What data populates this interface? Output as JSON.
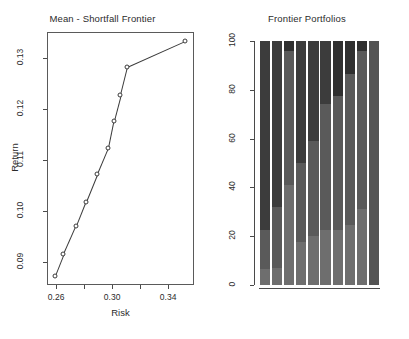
{
  "figure": {
    "panels": 2,
    "background": "#ffffff"
  },
  "left_panel": {
    "title": "Mean - Shortfall Frontier",
    "xlabel": "Risk",
    "ylabel": "Return"
  },
  "right_panel": {
    "title": "Frontier Portfolios"
  },
  "chart_data": [
    {
      "type": "line",
      "title": "Mean - Shortfall Frontier",
      "xlabel": "Risk",
      "ylabel": "Return",
      "xlim": [
        0.2535,
        0.3585
      ],
      "ylim": [
        0.0855,
        0.1352
      ],
      "xticks": [
        0.26,
        0.28,
        0.3,
        0.32,
        0.34
      ],
      "xticklabels": [
        "0.26",
        "",
        "0.30",
        "",
        "0.34"
      ],
      "yticks": [
        0.09,
        0.1,
        0.11,
        0.12,
        0.13
      ],
      "yticklabels": [
        "0.09",
        "0.10",
        "0.11",
        "0.12",
        "0.13"
      ],
      "grid": false,
      "legend": null,
      "marker": "open-circle",
      "series": [
        {
          "name": "Efficient frontier",
          "x": [
            0.259,
            0.2652,
            0.2742,
            0.281,
            0.2893,
            0.297,
            0.301,
            0.3058,
            0.3108,
            0.3523
          ],
          "y": [
            0.0872,
            0.0915,
            0.0971,
            0.1018,
            0.1074,
            0.1124,
            0.1178,
            0.1228,
            0.1283,
            0.1334
          ]
        }
      ]
    },
    {
      "type": "bar",
      "subtype": "stacked-percent",
      "title": "Frontier Portfolios",
      "xlabel": "",
      "ylabel": "",
      "ylim": [
        0,
        100
      ],
      "yticks": [
        0,
        20,
        40,
        60,
        80,
        100
      ],
      "yticklabels": [
        "0",
        "20",
        "40",
        "60",
        "80",
        "100"
      ],
      "xticklabels": [
        "",
        "",
        "",
        "",
        "",
        "",
        "",
        "",
        "",
        ""
      ],
      "grid": false,
      "legend": null,
      "categories": [
        "1",
        "2",
        "3",
        "4",
        "5",
        "6",
        "7",
        "8",
        "9",
        "10"
      ],
      "asset_colors": [
        "#6e6e6e",
        "#5a5a5a",
        "#3c3c3c",
        "#303030",
        "#4a4a4a",
        "#545454"
      ],
      "bars": [
        {
          "label": "1",
          "segments": [
            {
              "color": "#6e6e6e",
              "value": 6.5
            },
            {
              "color": "#5a5a5a",
              "value": 16.0
            },
            {
              "color": "#3c3c3c",
              "value": 77.5
            }
          ]
        },
        {
          "label": "2",
          "segments": [
            {
              "color": "#6e6e6e",
              "value": 7.0
            },
            {
              "color": "#5a5a5a",
              "value": 25.0
            },
            {
              "color": "#3c3c3c",
              "value": 68.0
            }
          ]
        },
        {
          "label": "3",
          "segments": [
            {
              "color": "#6e6e6e",
              "value": 41.0
            },
            {
              "color": "#5a5a5a",
              "value": 55.0
            },
            {
              "color": "#303030",
              "value": 4.0
            }
          ]
        },
        {
          "label": "4",
          "segments": [
            {
              "color": "#6e6e6e",
              "value": 17.5
            },
            {
              "color": "#5a5a5a",
              "value": 32.5
            },
            {
              "color": "#3c3c3c",
              "value": 50.0
            }
          ]
        },
        {
          "label": "5",
          "segments": [
            {
              "color": "#6e6e6e",
              "value": 20.0
            },
            {
              "color": "#5a5a5a",
              "value": 39.0
            },
            {
              "color": "#3c3c3c",
              "value": 41.0
            }
          ]
        },
        {
          "label": "6",
          "segments": [
            {
              "color": "#6e6e6e",
              "value": 22.5
            },
            {
              "color": "#5a5a5a",
              "value": 51.5
            },
            {
              "color": "#3c3c3c",
              "value": 26.0
            }
          ]
        },
        {
          "label": "7",
          "segments": [
            {
              "color": "#6e6e6e",
              "value": 22.5
            },
            {
              "color": "#5a5a5a",
              "value": 55.0
            },
            {
              "color": "#303030",
              "value": 22.5
            }
          ]
        },
        {
          "label": "8",
          "segments": [
            {
              "color": "#6e6e6e",
              "value": 24.5
            },
            {
              "color": "#5a5a5a",
              "value": 62.0
            },
            {
              "color": "#303030",
              "value": 13.5
            }
          ]
        },
        {
          "label": "9",
          "segments": [
            {
              "color": "#6e6e6e",
              "value": 31.0
            },
            {
              "color": "#5a5a5a",
              "value": 65.0
            },
            {
              "color": "#303030",
              "value": 4.0
            }
          ]
        },
        {
          "label": "10",
          "segments": [
            {
              "color": "#545454",
              "value": 100.0
            }
          ]
        }
      ]
    }
  ]
}
